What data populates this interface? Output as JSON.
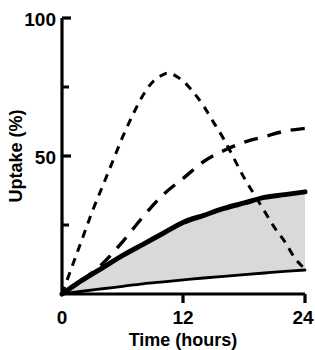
{
  "chart_data": {
    "type": "line",
    "title": "",
    "xlabel": "Time (hours)",
    "ylabel": "Uptake (%)",
    "xlim": [
      0,
      24
    ],
    "ylim": [
      0,
      100
    ],
    "xticks": [
      0,
      12,
      24
    ],
    "xticklabels": [
      "0",
      "12",
      "24"
    ],
    "yticks": [
      0,
      50,
      100
    ],
    "yticklabels": [
      "0",
      "50",
      "100"
    ],
    "yminorticks": [
      25,
      75
    ],
    "grid": false,
    "legend": "none",
    "shaded_region": {
      "label": "shaded band between bold-solid upper curve and thin-solid lower curve",
      "color": "#D9D9D9",
      "between": [
        "upper-solid-bold",
        "lower-solid-thin"
      ]
    },
    "series": [
      {
        "name": "short-dashed-peak",
        "style": "short-dashed",
        "linewidth": 2,
        "color": "#000000",
        "x": [
          0,
          1,
          2,
          3,
          4,
          5,
          6,
          7,
          8,
          9,
          10,
          10.5,
          11,
          12,
          13,
          14,
          15,
          16,
          17,
          18,
          19,
          20,
          21,
          22,
          23,
          24
        ],
        "y": [
          0,
          10,
          20,
          30,
          39,
          48,
          57,
          65,
          72,
          77,
          79.5,
          80,
          79.5,
          77,
          73,
          68,
          62,
          56,
          49,
          42,
          36,
          30,
          24,
          19,
          13,
          9
        ]
      },
      {
        "name": "long-dashed-rising",
        "style": "long-dashed",
        "linewidth": 3,
        "color": "#000000",
        "x": [
          0,
          2,
          4,
          6,
          8,
          10,
          12,
          14,
          16,
          18,
          20,
          22,
          24
        ],
        "y": [
          0,
          5,
          11,
          19,
          28,
          36,
          42,
          48,
          52,
          55,
          57,
          59,
          60
        ]
      },
      {
        "name": "upper-solid-bold",
        "style": "solid",
        "linewidth": 5,
        "color": "#000000",
        "x": [
          0,
          2,
          4,
          6,
          8,
          10,
          12,
          14,
          16,
          18,
          20,
          22,
          24
        ],
        "y": [
          0,
          5,
          9.5,
          14,
          18,
          22,
          26,
          28.5,
          31,
          33,
          35,
          36,
          37
        ]
      },
      {
        "name": "lower-solid-thin",
        "style": "solid",
        "linewidth": 2.5,
        "color": "#000000",
        "x": [
          0,
          2,
          4,
          6,
          8,
          10,
          12,
          14,
          16,
          18,
          20,
          22,
          24
        ],
        "y": [
          0,
          1,
          1.9,
          2.8,
          3.7,
          4.4,
          5.1,
          5.8,
          6.4,
          7,
          7.6,
          8.2,
          8.7
        ]
      }
    ]
  },
  "axes": {
    "y_title": "Uptake (%)",
    "x_title": "Time (hours)",
    "y_tick_100": "100",
    "y_tick_50": "50",
    "x_tick_0": "0",
    "x_tick_12": "12",
    "x_tick_24": "24"
  },
  "colors": {
    "line": "#000000",
    "band_fill": "#D9D9D9",
    "background": "#FFFFFF"
  }
}
